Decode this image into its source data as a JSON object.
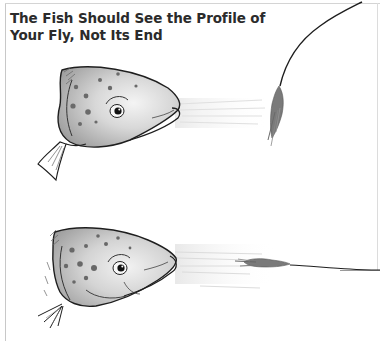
{
  "figure": {
    "title_lines": [
      "The Fish Should See the Profile of",
      "Your Fly, Not Its End"
    ],
    "panels": [
      {
        "id": "top",
        "description": "Trout head facing right; fly dangles vertically from a curved line, showing its end to the fish",
        "fly_orientation": "vertical"
      },
      {
        "id": "bottom",
        "description": "Trout head facing right; fly drifts horizontally on a straight line, showing its profile to the fish",
        "fly_orientation": "horizontal"
      }
    ]
  },
  "colors": {
    "title_text": "#2b2b2b",
    "ink": "#1e1e1e",
    "fish_shade_dark": "#9a9a9a",
    "fish_shade_light": "#eeeeee",
    "fly": "#7a7a7a",
    "frame": "#c8c8c8"
  }
}
